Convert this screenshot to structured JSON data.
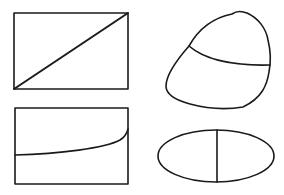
{
  "diagram": {
    "stroke_color": "#1a1a1a",
    "background": "#ffffff",
    "shapes": [
      {
        "id": "rectangle-diagonal",
        "kind": "rectangle",
        "x": 14,
        "y": 13,
        "width": 114,
        "height": 76,
        "divider": {
          "kind": "diagonal",
          "from": [
            14,
            89
          ],
          "to": [
            128,
            13
          ]
        }
      },
      {
        "id": "blob-chord",
        "kind": "irregular-closed-curve",
        "path": "M 232 14 C 236 11, 242 11, 247 13 C 258 18, 266 28, 268 40 C 271 52, 271 62, 269 72 C 267 85, 262 98, 243 107 C 225 110, 205 108, 190 104 C 175 100, 166 94, 166 86 C 166 75, 175 62, 189 46 C 198 30, 212 18, 232 14 Z",
        "divider": {
          "kind": "curved-chord",
          "path": "M 189 46 C 205 60, 235 66, 270 65"
        }
      },
      {
        "id": "rectangle-curve",
        "kind": "rectangle",
        "x": 15,
        "y": 108,
        "width": 113,
        "height": 76,
        "divider": {
          "kind": "rising-curve",
          "path": "M 15 155 C 60 154, 105 148, 120 140 C 125 137, 127 133, 128 129"
        }
      },
      {
        "id": "ellipse-vertical",
        "kind": "ellipse",
        "cx": 216,
        "cy": 156,
        "rx": 58,
        "ry": 26,
        "divider": {
          "kind": "vertical-line",
          "from": [
            217,
            130
          ],
          "to": [
            217,
            182
          ]
        }
      }
    ]
  }
}
